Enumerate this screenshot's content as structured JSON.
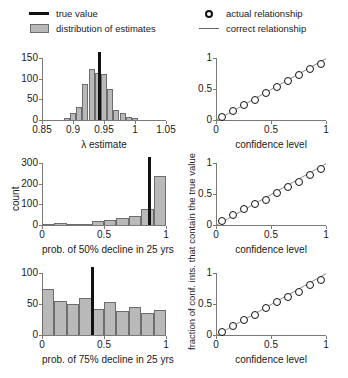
{
  "legend_left": {
    "items": [
      {
        "key": "thick-line",
        "label": "true value"
      },
      {
        "key": "gray-swatch",
        "label": "distribution of estimates"
      }
    ]
  },
  "legend_right": {
    "items": [
      {
        "key": "open-circle",
        "label": "actual relationship"
      },
      {
        "key": "thin-line",
        "label": "correct relationship"
      }
    ]
  },
  "shared": {
    "ylabel_scatter": "fraction of conf. ints. that contain the true value",
    "ylabel_hist": "count",
    "xlabel_scatter": "confidence level"
  },
  "chart_data": [
    {
      "id": "hist-lambda",
      "type": "bar",
      "title": "",
      "xlabel": "λ estimate",
      "ylabel": "",
      "xlim": [
        0.85,
        1.05
      ],
      "ylim": [
        0,
        150
      ],
      "xticks": [
        0.85,
        0.9,
        0.95,
        1,
        1.05
      ],
      "xticklabels": [
        "0.85",
        "0.9",
        "0.95",
        "1",
        "1.05"
      ],
      "yticks": [
        0,
        50,
        100,
        150
      ],
      "yticklabels": [
        "0",
        "50",
        "100",
        "150"
      ],
      "grid": false,
      "bin_width": 0.01,
      "bin_starts": [
        0.885,
        0.895,
        0.905,
        0.915,
        0.925,
        0.935,
        0.945,
        0.955,
        0.965,
        0.975,
        0.985,
        0.995
      ],
      "values": [
        4,
        16,
        32,
        88,
        124,
        113,
        112,
        76,
        24,
        18,
        8,
        4
      ],
      "true_value": 0.9435,
      "true_value_label": "true value"
    },
    {
      "id": "hist-p50",
      "type": "bar",
      "title": "",
      "xlabel": "prob. of 50% decline in 25 yrs",
      "ylabel": "count",
      "xlim": [
        0,
        1
      ],
      "ylim": [
        0,
        300
      ],
      "xticks": [
        0,
        0.5,
        1
      ],
      "xticklabels": [
        "0",
        "0.5",
        "1"
      ],
      "yticks": [
        0,
        100,
        200,
        300
      ],
      "yticklabels": [
        "0",
        "100",
        "200",
        "300"
      ],
      "grid": false,
      "bin_width": 0.1,
      "bin_starts": [
        0,
        0.1,
        0.2,
        0.3,
        0.4,
        0.5,
        0.6,
        0.7,
        0.8,
        0.9
      ],
      "values": [
        4,
        8,
        7,
        6,
        17,
        24,
        34,
        43,
        76,
        238
      ],
      "true_value": 0.87,
      "true_value_label": "true value"
    },
    {
      "id": "hist-p75",
      "type": "bar",
      "title": "",
      "xlabel": "prob. of 75% decline in 25 yrs",
      "ylabel": "",
      "xlim": [
        0,
        1
      ],
      "ylim": [
        0,
        100
      ],
      "xticks": [
        0,
        0.5,
        1
      ],
      "xticklabels": [
        "0",
        "0.5",
        "1"
      ],
      "yticks": [
        0,
        50,
        100
      ],
      "yticklabels": [
        "0",
        "50",
        "100"
      ],
      "grid": false,
      "bin_width": 0.1,
      "bin_starts": [
        0,
        0.1,
        0.2,
        0.3,
        0.4,
        0.5,
        0.6,
        0.7,
        0.8,
        0.9
      ],
      "values": [
        75,
        55,
        50,
        60,
        42,
        54,
        39,
        45,
        36,
        40
      ],
      "true_value": 0.405,
      "true_value_label": "true value"
    },
    {
      "id": "coverage-1",
      "type": "scatter",
      "title": "",
      "xlabel": "confidence level",
      "ylabel": "fraction of conf. ints. that contain the true value",
      "xlim": [
        0,
        1
      ],
      "ylim": [
        0,
        1
      ],
      "xticks": [
        0,
        0.5,
        1
      ],
      "xticklabels": [
        "0",
        "0.5",
        "1"
      ],
      "yticks": [
        0,
        0.5,
        1
      ],
      "yticklabels": [
        "0",
        "0.5",
        "1"
      ],
      "grid": false,
      "x": [
        0.05,
        0.15,
        0.25,
        0.35,
        0.45,
        0.55,
        0.65,
        0.75,
        0.85,
        0.95
      ],
      "y": [
        0.05,
        0.15,
        0.25,
        0.33,
        0.44,
        0.53,
        0.63,
        0.73,
        0.82,
        0.91
      ],
      "reference_line": {
        "from": [
          0,
          0
        ],
        "to": [
          1,
          1
        ],
        "label": "correct relationship"
      }
    },
    {
      "id": "coverage-2",
      "type": "scatter",
      "title": "",
      "xlabel": "confidence level",
      "ylabel": "fraction of conf. ints. that contain the true value",
      "xlim": [
        0,
        1
      ],
      "ylim": [
        0,
        1
      ],
      "xticks": [
        0,
        0.5,
        1
      ],
      "xticklabels": [
        "0",
        "0.5",
        "1"
      ],
      "yticks": [
        0,
        0.5,
        1
      ],
      "yticklabels": [
        "0",
        "0.5",
        "1"
      ],
      "grid": false,
      "x": [
        0.05,
        0.15,
        0.25,
        0.35,
        0.45,
        0.55,
        0.65,
        0.75,
        0.85,
        0.95
      ],
      "y": [
        0.06,
        0.16,
        0.26,
        0.34,
        0.41,
        0.51,
        0.62,
        0.7,
        0.8,
        0.9
      ],
      "reference_line": {
        "from": [
          0,
          0
        ],
        "to": [
          1,
          1
        ],
        "label": "correct relationship"
      }
    },
    {
      "id": "coverage-3",
      "type": "scatter",
      "title": "",
      "xlabel": "confidence level",
      "ylabel": "fraction of conf. ints. that contain the true value",
      "xlim": [
        0,
        1
      ],
      "ylim": [
        0,
        1
      ],
      "xticks": [
        0,
        0.5,
        1
      ],
      "xticklabels": [
        "0",
        "0.5",
        "1"
      ],
      "yticks": [
        0,
        0.5,
        1
      ],
      "yticklabels": [
        "0",
        "0.5",
        "1"
      ],
      "grid": false,
      "x": [
        0.05,
        0.15,
        0.25,
        0.35,
        0.45,
        0.55,
        0.65,
        0.75,
        0.85,
        0.95
      ],
      "y": [
        0.05,
        0.14,
        0.24,
        0.33,
        0.44,
        0.54,
        0.62,
        0.7,
        0.8,
        0.89
      ],
      "reference_line": {
        "from": [
          0,
          0
        ],
        "to": [
          1,
          1
        ],
        "label": "correct relationship"
      }
    }
  ]
}
